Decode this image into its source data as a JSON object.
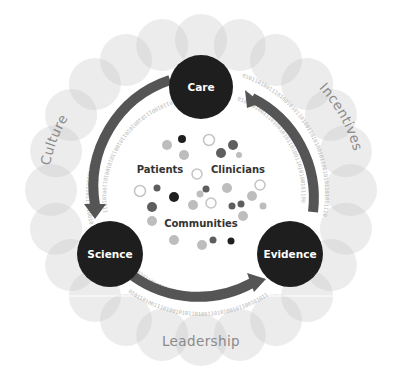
{
  "diagram": {
    "type": "cycle",
    "center": [
      201,
      190
    ],
    "outer_ring": {
      "radius": 150,
      "bubble_radius": 26,
      "bubble_count": 24,
      "bubble_color": "#c8c8c8",
      "labels": [
        {
          "id": "culture",
          "text": "Culture"
        },
        {
          "id": "incentives",
          "text": "Incentives"
        },
        {
          "id": "leadership",
          "text": "Leadership"
        }
      ]
    },
    "nodes": [
      {
        "id": "care",
        "label": "Care",
        "x": 201,
        "y": 87,
        "r": 32
      },
      {
        "id": "science",
        "label": "Science",
        "x": 110,
        "y": 254,
        "r": 33
      },
      {
        "id": "evidence",
        "label": "Evidence",
        "x": 290,
        "y": 254,
        "r": 33
      }
    ],
    "arrows": [
      {
        "from": "care",
        "to": "science"
      },
      {
        "from": "science",
        "to": "evidence"
      },
      {
        "from": "evidence",
        "to": "care"
      }
    ],
    "arrow_color": "#555555",
    "binary_text": "0101101001110100101011010011010100101100101011010011101001010110100110101001011001010110100111010010101101001101010010110010101101001110100101011010011010100101100101011010011101001010110",
    "center_labels": [
      {
        "id": "patients",
        "text": "Patients"
      },
      {
        "id": "clinicians",
        "text": "Clinicians"
      },
      {
        "id": "communities",
        "text": "Communities"
      }
    ],
    "colors": {
      "node_fill": "#1e1e1e",
      "dark_dot": "#1f1f1f",
      "mid_dot": "#5e5e5e",
      "light_dot": "#bdbdbd",
      "hollow_stroke": "#c4c4c4",
      "ring_label": "#8a8a8a"
    }
  }
}
